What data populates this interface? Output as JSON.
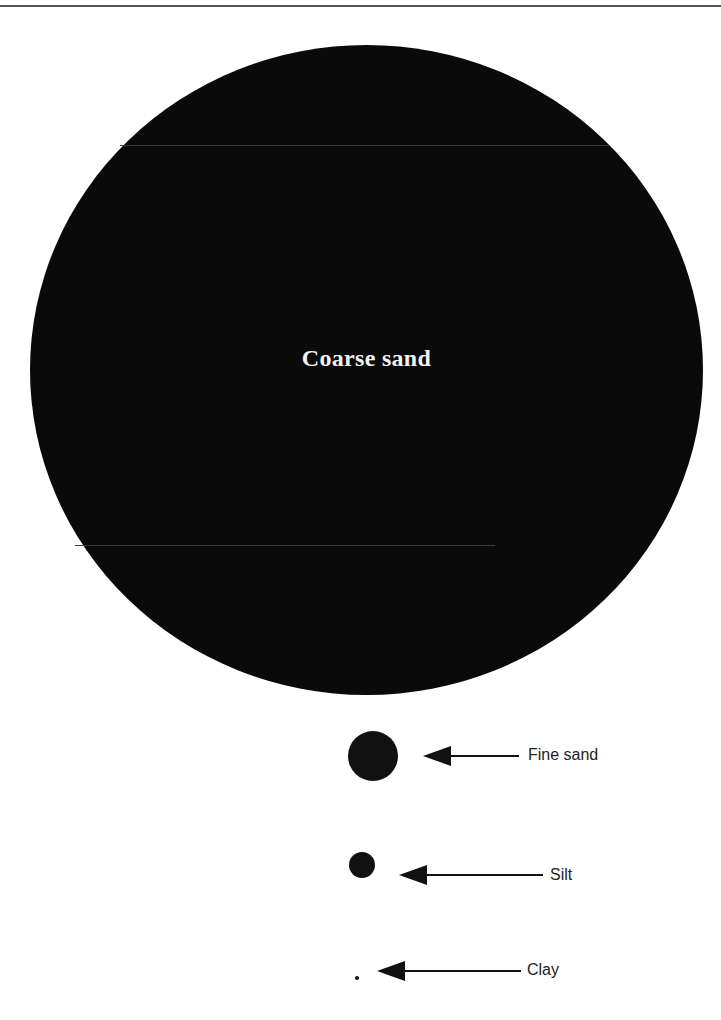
{
  "diagram": {
    "type": "particle-size-comparison",
    "particles": [
      {
        "name": "Coarse sand",
        "label": "Coarse sand",
        "relative_diameter_px": 673
      },
      {
        "name": "Fine sand",
        "label": "Fine sand",
        "relative_diameter_px": 50
      },
      {
        "name": "Silt",
        "label": "Silt",
        "relative_diameter_px": 26
      },
      {
        "name": "Clay",
        "label": "Clay",
        "relative_diameter_px": 4
      }
    ]
  },
  "colors": {
    "particle": "#111111",
    "background": "#ffffff",
    "label_on_dark": "#f2f2f2"
  }
}
